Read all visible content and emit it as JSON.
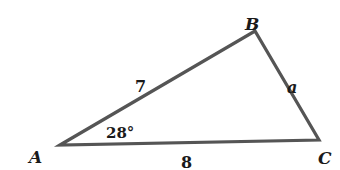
{
  "diagram": {
    "type": "triangle",
    "stroke_color": "#555555",
    "text_color": "#1a1a1a",
    "vertices": [
      {
        "id": "A",
        "label": "A",
        "x": 60,
        "y": 145
      },
      {
        "id": "B",
        "label": "B",
        "x": 255,
        "y": 31
      },
      {
        "id": "C",
        "label": "C",
        "x": 319,
        "y": 140
      }
    ],
    "sides": {
      "AB": {
        "label": "7"
      },
      "BC": {
        "label": "a"
      },
      "AC": {
        "label": "8"
      }
    },
    "angles": {
      "A": {
        "label": "28°"
      }
    }
  }
}
